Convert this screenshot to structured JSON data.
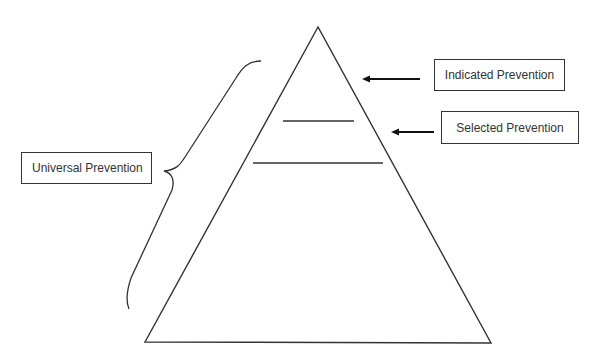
{
  "diagram": {
    "type": "prevention-pyramid",
    "labels": {
      "universal": "Universal Prevention",
      "selected": "Selected Prevention",
      "indicated": "Indicated Prevention"
    },
    "colors": {
      "stroke": "#333333",
      "background": "#ffffff"
    }
  }
}
